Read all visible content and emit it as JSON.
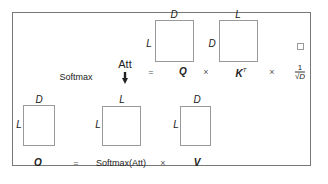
{
  "top": {
    "att_label": "Att",
    "equals": "=",
    "q_label": "Q",
    "times1": "×",
    "kt_label": "K",
    "kt_sup": "T",
    "times2": "×",
    "scale_num": "1",
    "scale_den": "√D",
    "softmax_label": "Softmax",
    "q_box": {
      "top_dim": "D",
      "left_dim": "L"
    },
    "k_box": {
      "top_dim": "L",
      "left_dim": "D"
    }
  },
  "bottom": {
    "o_label": "O",
    "equals": "=",
    "softmax_att_label": "Softmax(Att)",
    "times": "×",
    "v_label": "V",
    "o_box": {
      "top_dim": "D",
      "left_dim": "L"
    },
    "sm_box": {
      "top_dim": "L",
      "left_dim": "L"
    },
    "v_box": {
      "top_dim": "D",
      "left_dim": "L"
    }
  }
}
